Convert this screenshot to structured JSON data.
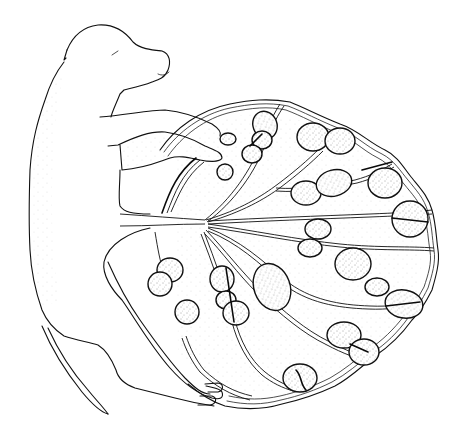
{
  "figure": {
    "style": "stippled-line-drawing",
    "colors": {
      "background": "#ffffff",
      "ink": "#111111"
    },
    "parts": {
      "fetus": "fetus",
      "umbilical_cord": "umbilical-cord",
      "placenta": "placenta",
      "cotyledons_count": 26
    }
  }
}
